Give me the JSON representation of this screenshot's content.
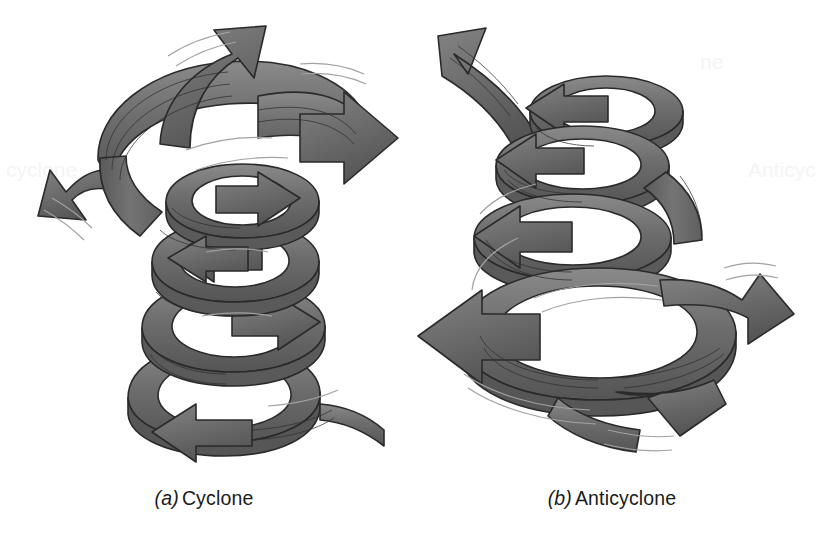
{
  "figure": {
    "background_color": "#ffffff",
    "ribbon_color": "#6e6e6e",
    "ribbon_shadow_color": "#4f4f4f",
    "ribbon_highlight_color": "#8d8d8d",
    "outline_color": "#2a2a2a",
    "striation_color": "#2f2f2f",
    "motion_line_color": "#9a9a9a",
    "caption_color": "#1b1b1b",
    "width": 816,
    "height": 536
  },
  "panels": [
    {
      "id": "cyclone",
      "label": "(a)",
      "name": "Cyclone",
      "rotation": "counterclockwise",
      "vertical_motion": "rising",
      "flow": "converging inflow at base, spiralling upward and outward, diverging outflow aloft",
      "spiral_turns": 4,
      "inflow_arrows": 1,
      "outflow_arrows": 3,
      "shape": "cone widening upward"
    },
    {
      "id": "anticyclone",
      "label": "(b)",
      "name": "Anticyclone",
      "rotation": "clockwise",
      "vertical_motion": "sinking",
      "flow": "inflow aloft, spiralling downward and outward, diverging outflow at base",
      "spiral_turns": 4,
      "inflow_arrows": 1,
      "outflow_arrows": 3,
      "shape": "cone widening downward"
    }
  ],
  "ghost_artifacts": [
    {
      "text": "cyclone",
      "x": 6,
      "y": 168
    },
    {
      "text": "Anticyc",
      "x": 748,
      "y": 168
    },
    {
      "text": "ne",
      "x": 700,
      "y": 60
    }
  ]
}
